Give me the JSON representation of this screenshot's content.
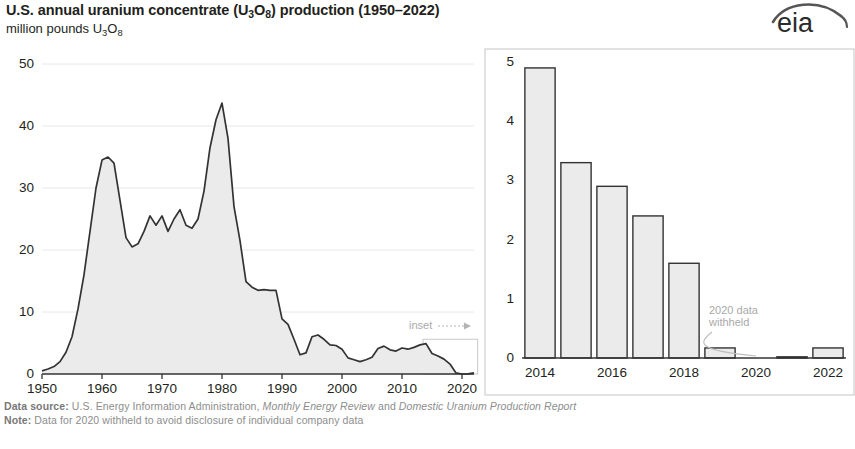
{
  "header": {
    "title_pre": "U.S. annual uranium concentrate (U",
    "title_sub1": "3",
    "title_mid": "O",
    "title_sub2": "8",
    "title_post": ") production (1950–2022)",
    "title_full": "U.S. annual uranium concentrate (U3O8) production (1950–2022)",
    "subtitle_pre": "million pounds U",
    "subtitle_sub1": "3",
    "subtitle_mid": "O",
    "subtitle_sub2": "8",
    "subtitle_full": "million pounds U3O8",
    "logo_text": "eia"
  },
  "footer": {
    "line1_label": "Data source:",
    "line1_a": " U.S. Energy Information Administration, ",
    "line1_i1": "Monthly Energy Review",
    "line1_b": " and ",
    "line1_i2": "Domestic Uranium Production Report",
    "line2_label": "Note:",
    "line2_text": " Data for 2020 withheld to avoid disclosure of individual company data"
  },
  "annotations": {
    "inset": "inset",
    "withheld_line1": "2020 data",
    "withheld_line2": "withheld"
  },
  "colors": {
    "line": "#333333",
    "fill": "#ebebeb",
    "axis": "#333333",
    "grid": "#e8e8e8",
    "annotation": "#a9a9a9",
    "text": "#231f20",
    "footer": "#8d8d8d"
  },
  "chart_data": [
    {
      "type": "area",
      "id": "main",
      "title": "U.S. annual uranium concentrate (U3O8) production (1950–2022)",
      "ylabel": "million pounds U3O8",
      "xlabel": "",
      "ylim": [
        0,
        50
      ],
      "xlim": [
        1950,
        2022
      ],
      "yticks": [
        0,
        10,
        20,
        30,
        40,
        50
      ],
      "xticks": [
        1950,
        1960,
        1970,
        1980,
        1990,
        2000,
        2010,
        2020
      ],
      "grid": true,
      "x": [
        1950,
        1951,
        1952,
        1953,
        1954,
        1955,
        1956,
        1957,
        1958,
        1959,
        1960,
        1961,
        1962,
        1963,
        1964,
        1965,
        1966,
        1967,
        1968,
        1969,
        1970,
        1971,
        1972,
        1973,
        1974,
        1975,
        1976,
        1977,
        1978,
        1979,
        1980,
        1981,
        1982,
        1983,
        1984,
        1985,
        1986,
        1987,
        1988,
        1989,
        1990,
        1991,
        1992,
        1993,
        1994,
        1995,
        1996,
        1997,
        1998,
        1999,
        2000,
        2001,
        2002,
        2003,
        2004,
        2005,
        2006,
        2007,
        2008,
        2009,
        2010,
        2011,
        2012,
        2013,
        2014,
        2015,
        2016,
        2017,
        2018,
        2019,
        2020,
        2021,
        2022
      ],
      "values": [
        0.5,
        0.8,
        1.2,
        2.0,
        3.5,
        6.0,
        10.5,
        16.0,
        23.0,
        30.0,
        34.5,
        35.0,
        34.0,
        28.0,
        22.0,
        20.5,
        21.0,
        23.0,
        25.5,
        24.0,
        25.5,
        23.0,
        25.0,
        26.5,
        24.0,
        23.5,
        25.0,
        29.5,
        36.5,
        41.0,
        43.7,
        38.0,
        27.0,
        21.5,
        14.9,
        14.0,
        13.5,
        13.6,
        13.5,
        13.5,
        8.9,
        8.0,
        5.6,
        3.1,
        3.4,
        6.0,
        6.3,
        5.6,
        4.7,
        4.6,
        4.0,
        2.6,
        2.3,
        2.0,
        2.3,
        2.7,
        4.1,
        4.5,
        3.9,
        3.7,
        4.2,
        4.0,
        4.3,
        4.7,
        4.9,
        3.3,
        2.9,
        2.4,
        1.6,
        0.17,
        0.0,
        0.02,
        0.17
      ]
    },
    {
      "type": "bar",
      "id": "inset",
      "title": "",
      "ylim": [
        0,
        5
      ],
      "yticks": [
        0,
        1,
        2,
        3,
        4,
        5
      ],
      "xticks": [
        2014,
        2016,
        2018,
        2020,
        2022
      ],
      "categories": [
        2014,
        2015,
        2016,
        2017,
        2018,
        2019,
        2020,
        2021,
        2022
      ],
      "values": [
        4.9,
        3.3,
        2.9,
        2.4,
        1.6,
        0.17,
        0.0,
        0.02,
        0.17
      ],
      "grid": false
    }
  ]
}
